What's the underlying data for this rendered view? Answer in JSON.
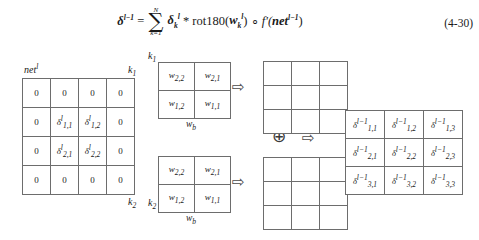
{
  "equation": {
    "number": "(4-30)",
    "lhs_symbol": "δ",
    "lhs_superscript": "l−1",
    "equals": "=",
    "sum_upper": "N",
    "sum_lower": "k=1",
    "sum_symbol": "∑",
    "delta_symbol": "δ",
    "delta_subscript": "k",
    "delta_superscript": "l",
    "conv_operator": "*",
    "rot_function": "rot180(",
    "weight_symbol": "w",
    "weight_subscript": "k",
    "weight_superscript": "l",
    "rot_close": ")",
    "hadamard_operator": "∘",
    "derivative_function": "f′(",
    "net_symbol": "net",
    "net_superscript": "l−1",
    "derivative_close": ")"
  },
  "net_matrix": {
    "label": "net",
    "label_superscript": "l",
    "corner_top_right": "k",
    "corner_top_right_sub": "1",
    "corner_bottom_right": "k",
    "corner_bottom_right_sub": "2",
    "rows": [
      [
        {
          "text": "0",
          "type": "zero"
        },
        {
          "text": "0",
          "type": "zero"
        },
        {
          "text": "0",
          "type": "zero"
        },
        {
          "text": "0",
          "type": "zero"
        }
      ],
      [
        {
          "text": "0",
          "type": "zero"
        },
        {
          "symbol": "δ",
          "sup": "l",
          "sub": "1,1",
          "type": "delta"
        },
        {
          "symbol": "δ",
          "sup": "l",
          "sub": "1,2",
          "type": "delta"
        },
        {
          "text": "0",
          "type": "zero"
        }
      ],
      [
        {
          "text": "0",
          "type": "zero"
        },
        {
          "symbol": "δ",
          "sup": "l",
          "sub": "2,1",
          "type": "delta"
        },
        {
          "symbol": "δ",
          "sup": "l",
          "sub": "2,2",
          "type": "delta"
        },
        {
          "text": "0",
          "type": "zero"
        }
      ],
      [
        {
          "text": "0",
          "type": "zero"
        },
        {
          "text": "0",
          "type": "zero"
        },
        {
          "text": "0",
          "type": "zero"
        },
        {
          "text": "0",
          "type": "zero"
        }
      ]
    ]
  },
  "kernels": [
    {
      "tag": "k",
      "tag_sub": "1",
      "caption": "w",
      "caption_sub": "b",
      "rows": [
        [
          {
            "symbol": "w",
            "sub": "2,2"
          },
          {
            "symbol": "w",
            "sub": "2,1"
          }
        ],
        [
          {
            "symbol": "w",
            "sub": "1,2"
          },
          {
            "symbol": "w",
            "sub": "1,1"
          }
        ]
      ]
    },
    {
      "tag": "k",
      "tag_sub": "2",
      "caption": "w",
      "caption_sub": "b",
      "rows": [
        [
          {
            "symbol": "w",
            "sub": "2,2"
          },
          {
            "symbol": "w",
            "sub": "2,1"
          }
        ],
        [
          {
            "symbol": "w",
            "sub": "1,2"
          },
          {
            "symbol": "w",
            "sub": "1,1"
          }
        ]
      ]
    }
  ],
  "intermediate_grids": [
    {
      "rows": 3,
      "cols": 3,
      "cells": [
        [
          "",
          "",
          ""
        ],
        [
          "",
          "",
          ""
        ],
        [
          "",
          "",
          ""
        ]
      ]
    },
    {
      "rows": 3,
      "cols": 3,
      "cells": [
        [
          "",
          "",
          ""
        ],
        [
          "",
          "",
          ""
        ],
        [
          "",
          "",
          ""
        ]
      ]
    }
  ],
  "operators": {
    "arrow": "⇨",
    "plus_circle": "⊕"
  },
  "delta_matrix": {
    "rows": [
      [
        {
          "symbol": "δ",
          "sup": "l−1",
          "sub": "1,1"
        },
        {
          "symbol": "δ",
          "sup": "l−1",
          "sub": "1,2"
        },
        {
          "symbol": "δ",
          "sup": "l−1",
          "sub": "1,3"
        }
      ],
      [
        {
          "symbol": "δ",
          "sup": "l−1",
          "sub": "2,1"
        },
        {
          "symbol": "δ",
          "sup": "l−1",
          "sub": "2,2"
        },
        {
          "symbol": "δ",
          "sup": "l−1",
          "sub": "2,3"
        }
      ],
      [
        {
          "symbol": "δ",
          "sup": "l−1",
          "sub": "3,1"
        },
        {
          "symbol": "δ",
          "sup": "l−1",
          "sub": "3,2"
        },
        {
          "symbol": "δ",
          "sup": "l−1",
          "sub": "3,3"
        }
      ]
    ]
  }
}
